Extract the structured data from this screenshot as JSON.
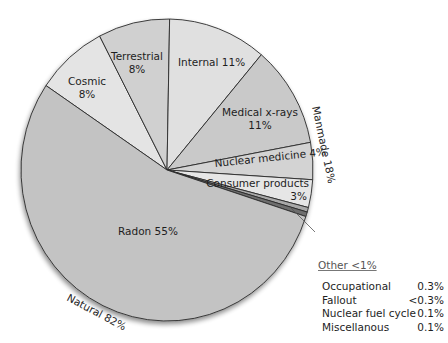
{
  "chart_data": {
    "type": "pie",
    "title": "",
    "slices": [
      {
        "label": "Radon",
        "value": 55,
        "display": "Radon 55%",
        "group": "Natural",
        "color": "#c3c3c3"
      },
      {
        "label": "Cosmic",
        "value": 8,
        "display": "Cosmic 8%",
        "group": "Natural",
        "color": "#e4e4e4"
      },
      {
        "label": "Terrestrial",
        "value": 8,
        "display": "Terrestrial 8%",
        "group": "Natural",
        "color": "#d0d0d0"
      },
      {
        "label": "Internal",
        "value": 11,
        "display": "Internal 11%",
        "group": "Natural",
        "color": "#e0e0e0"
      },
      {
        "label": "Medical x-rays",
        "value": 11,
        "display": "Medical x-rays 11%",
        "group": "Manmade",
        "color": "#c9c9c9"
      },
      {
        "label": "Nuclear medicine",
        "value": 4,
        "display": "Nuclear medicine 4%",
        "group": "Manmade",
        "color": "#d3d3d3"
      },
      {
        "label": "Consumer products",
        "value": 3,
        "display": "Consumer products 3%",
        "group": "Manmade",
        "color": "#e6e6e6"
      },
      {
        "label": "Other",
        "value": 1,
        "display": "Other <1%",
        "group": "Manmade",
        "color": "#9a9a9a"
      }
    ],
    "groups": [
      {
        "label": "Natural 82%",
        "value": 82
      },
      {
        "label": "Manmade 18%",
        "value": 18
      }
    ],
    "other_breakdown": [
      {
        "label": "Occupational",
        "value": "0.3%"
      },
      {
        "label": "Fallout",
        "value": "<0.3%"
      },
      {
        "label": "Nuclear fuel cycle",
        "value": "0.1%"
      },
      {
        "label": "Miscellanous",
        "value": "0.1%"
      }
    ],
    "legend_position": "bottom-right"
  },
  "labels": {
    "terrestrial": [
      "Terrestrial",
      "8%"
    ],
    "cosmic": [
      "Cosmic",
      "8%"
    ],
    "internal": "Internal 11%",
    "medical": [
      "Medical x-rays",
      "11%"
    ],
    "nuclear_medicine": "Nuclear medicine 4%",
    "consumer": [
      "Consumer products",
      "3%"
    ],
    "radon": "Radon 55%",
    "natural": "Natural 82%",
    "manmade": "Manmade 18%",
    "other_title": "Other <1%"
  }
}
